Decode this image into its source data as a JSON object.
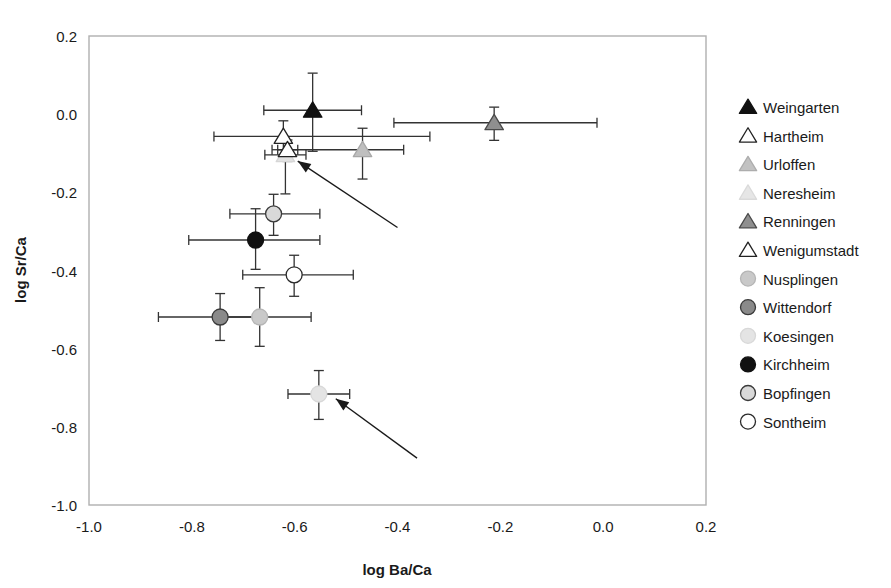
{
  "chart_data": {
    "type": "scatter",
    "title": "",
    "xlabel": "log Ba/Ca",
    "ylabel": "log Sr/Ca",
    "xlim": [
      -1.0,
      0.2
    ],
    "ylim": [
      -1.0,
      0.2
    ],
    "xticks": [
      "-1.0",
      "-0.8",
      "-0.6",
      "-0.4",
      "-0.2",
      "0.0",
      "0.2"
    ],
    "xtick_values": [
      -1.0,
      -0.8,
      -0.6,
      -0.4,
      -0.2,
      0.0,
      0.2
    ],
    "yticks": [
      "0.2",
      "0.0",
      "-0.2",
      "-0.4",
      "-0.6",
      "-0.8",
      "-1.0"
    ],
    "ytick_values": [
      0.2,
      0.0,
      -0.2,
      -0.4,
      -0.6,
      -0.8,
      -1.0
    ],
    "grid": false,
    "legend_position": "right-outside",
    "error_bars": "both",
    "points": [
      {
        "name": "Weingarten",
        "marker": "triangle-filled",
        "color": "#111111",
        "edge": "#111111",
        "x": -0.565,
        "y": 0.01,
        "xerr_low": 0.095,
        "xerr_high": 0.095,
        "yerr_low": 0.105,
        "yerr_high": 0.095
      },
      {
        "name": "Hartheim",
        "marker": "triangle-open",
        "color": "#ffffff",
        "edge": "#222222",
        "x": -0.622,
        "y": -0.057,
        "xerr_low": 0.135,
        "xerr_high": 0.285,
        "yerr_low": 0.055,
        "yerr_high": 0.04
      },
      {
        "name": "Urloffen",
        "marker": "triangle-filled",
        "color": "#bfbfbf",
        "edge": "#a8a8a8",
        "x": -0.468,
        "y": -0.091,
        "xerr_low": 0.165,
        "xerr_high": 0.08,
        "yerr_low": 0.075,
        "yerr_high": 0.055
      },
      {
        "name": "Neresheim",
        "marker": "triangle-filled",
        "color": "#e2e2e2",
        "edge": "#d6d6d6",
        "x": -0.618,
        "y": -0.104,
        "xerr_low": 0.04,
        "xerr_high": 0.04,
        "yerr_low": 0.1,
        "yerr_high": 0.03
      },
      {
        "name": "Renningen",
        "marker": "triangle-filled",
        "color": "#8f8f8f",
        "edge": "#4a4a4a",
        "x": -0.212,
        "y": -0.022,
        "xerr_low": 0.195,
        "xerr_high": 0.2,
        "yerr_low": 0.045,
        "yerr_high": 0.04
      },
      {
        "name": "Wenigumstadt",
        "marker": "triangle-open",
        "color": "#ffffff",
        "edge": "#222222",
        "x": -0.614,
        "y": -0.091,
        "xerr_low": 0.03,
        "xerr_high": 0.02,
        "yerr_low": 0.03,
        "yerr_high": 0.025
      },
      {
        "name": "Nusplingen",
        "marker": "circle-filled",
        "color": "#c9c9c9",
        "edge": "#b5b5b5",
        "x": -0.668,
        "y": -0.519,
        "xerr_low": 0.07,
        "xerr_high": 0.1,
        "yerr_low": 0.075,
        "yerr_high": 0.075
      },
      {
        "name": "Wittendorf",
        "marker": "circle-filled",
        "color": "#8a8a8a",
        "edge": "#3a3a3a",
        "x": -0.745,
        "y": -0.519,
        "xerr_low": 0.12,
        "xerr_high": 0.075,
        "yerr_low": 0.06,
        "yerr_high": 0.06
      },
      {
        "name": "Koesingen",
        "marker": "circle-filled",
        "color": "#e4e4e4",
        "edge": "#d8d8d8",
        "x": -0.553,
        "y": -0.716,
        "xerr_low": 0.06,
        "xerr_high": 0.06,
        "yerr_low": 0.065,
        "yerr_high": 0.06
      },
      {
        "name": "Kirchheim",
        "marker": "circle-filled",
        "color": "#111111",
        "edge": "#111111",
        "x": -0.676,
        "y": -0.322,
        "xerr_low": 0.13,
        "xerr_high": 0.125,
        "yerr_low": 0.075,
        "yerr_high": 0.08
      },
      {
        "name": "Bopfingen",
        "marker": "circle-open",
        "color": "#d9d9d9",
        "edge": "#3a3a3a",
        "x": -0.641,
        "y": -0.255,
        "xerr_low": 0.085,
        "xerr_high": 0.09,
        "yerr_low": 0.055,
        "yerr_high": 0.05
      },
      {
        "name": "Sontheim",
        "marker": "circle-open",
        "color": "#ffffff",
        "edge": "#2a2a2a",
        "x": -0.601,
        "y": -0.411,
        "xerr_low": 0.1,
        "xerr_high": 0.115,
        "yerr_low": 0.055,
        "yerr_high": 0.05
      }
    ],
    "annotations": [
      {
        "name": "arrow-to-neresheim",
        "type": "arrow",
        "from_x": -0.4,
        "from_y": -0.29,
        "to_x": -0.594,
        "to_y": -0.12
      },
      {
        "name": "arrow-to-koesingen",
        "type": "arrow",
        "from_x": -0.362,
        "from_y": -0.88,
        "to_x": -0.52,
        "to_y": -0.728
      }
    ]
  },
  "legend": {
    "items": [
      {
        "label": "Weingarten",
        "marker": "triangle-filled",
        "color": "#111111",
        "edge": "#111111"
      },
      {
        "label": "Hartheim",
        "marker": "triangle-open",
        "color": "#ffffff",
        "edge": "#222222"
      },
      {
        "label": "Urloffen",
        "marker": "triangle-filled",
        "color": "#c2c2c2",
        "edge": "#adadad"
      },
      {
        "label": "Neresheim",
        "marker": "triangle-filled",
        "color": "#e6e6e6",
        "edge": "#dadada"
      },
      {
        "label": "Renningen",
        "marker": "triangle-filled",
        "color": "#8f8f8f",
        "edge": "#4a4a4a"
      },
      {
        "label": "Wenigumstadt",
        "marker": "triangle-open",
        "color": "#ffffff",
        "edge": "#222222"
      },
      {
        "label": "Nusplingen",
        "marker": "circle-filled",
        "color": "#c9c9c9",
        "edge": "#b5b5b5"
      },
      {
        "label": "Wittendorf",
        "marker": "circle-filled",
        "color": "#8a8a8a",
        "edge": "#3a3a3a"
      },
      {
        "label": "Koesingen",
        "marker": "circle-filled",
        "color": "#e4e4e4",
        "edge": "#d8d8d8"
      },
      {
        "label": "Kirchheim",
        "marker": "circle-filled",
        "color": "#111111",
        "edge": "#111111"
      },
      {
        "label": "Bopfingen",
        "marker": "circle-open",
        "color": "#d9d9d9",
        "edge": "#3a3a3a"
      },
      {
        "label": "Sontheim",
        "marker": "circle-open",
        "color": "#ffffff",
        "edge": "#2a2a2a"
      }
    ]
  },
  "plot_style": {
    "frame_color": "#b0b0b0",
    "error_bar_color": "#333333",
    "text_color": "#1a1a1a",
    "background": "#ffffff"
  }
}
